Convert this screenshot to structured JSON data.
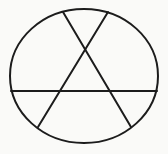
{
  "figure": {
    "canvas": {
      "width": 168,
      "height": 154
    },
    "background_color": "#fafaf8",
    "stroke_color": "#1c1c1c",
    "stroke_width": 2,
    "ellipse": {
      "cx": 84,
      "cy": 76,
      "rx": 74,
      "ry": 67
    },
    "chords": [
      {
        "name": "horizontal-chord",
        "x1": 11,
        "y1": 91,
        "x2": 157,
        "y2": 91
      },
      {
        "name": "diagonal-chord-topleft-bottomright",
        "x1": 63,
        "y1": 12,
        "x2": 131,
        "y2": 127
      },
      {
        "name": "diagonal-chord-topright-bottomleft",
        "x1": 108,
        "y1": 12,
        "x2": 38,
        "y2": 127
      }
    ]
  }
}
